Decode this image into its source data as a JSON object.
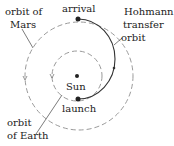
{
  "diagram": {
    "labels": {
      "mars_orbit_line1": "orbit of",
      "mars_orbit_line2": "Mars",
      "arrival": "arrival",
      "hohmann_line1": "Hohmann",
      "hohmann_line2": "transfer",
      "hohmann_line3": "orbit",
      "sun": "Sun",
      "launch": "launch",
      "earth_orbit_line1": "orbit",
      "earth_orbit_line2": "of Earth"
    },
    "colors": {
      "orbit_dash": "#9a9a9a",
      "transfer": "#333333",
      "text": "#222222"
    }
  }
}
